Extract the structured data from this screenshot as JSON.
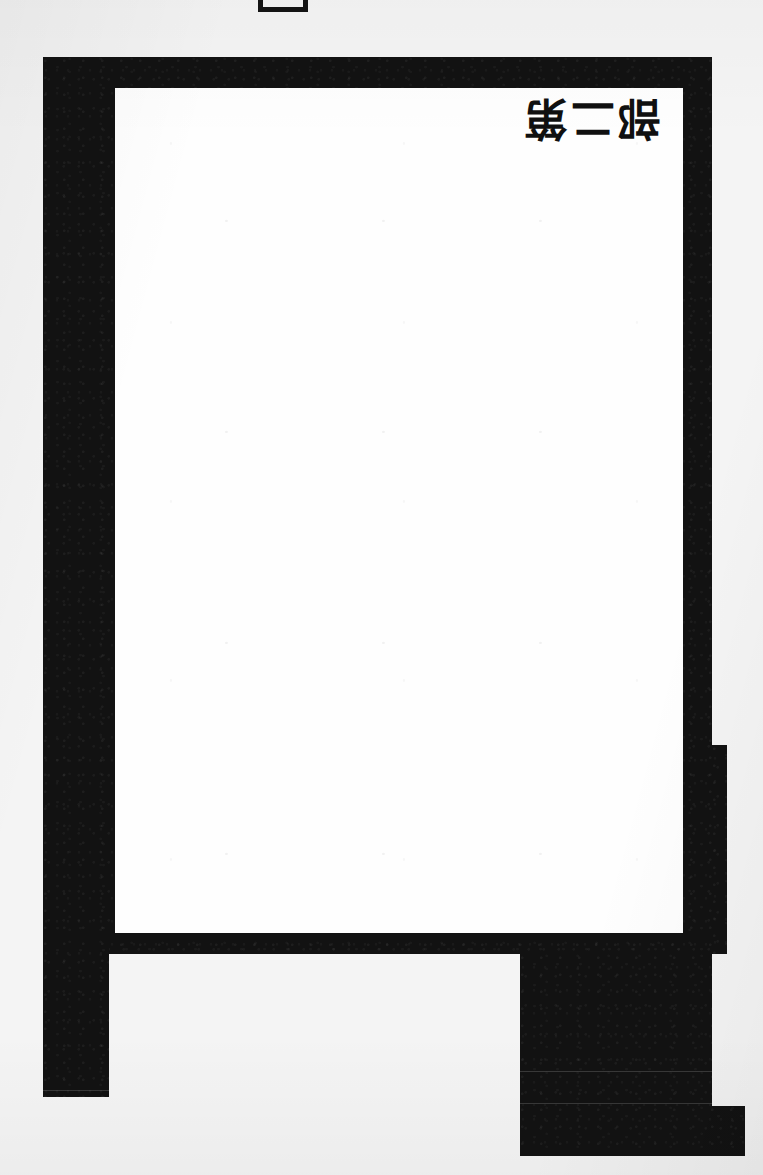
{
  "document": {
    "kind": "scanned-page",
    "orientation": "rotated-90",
    "background_color": "#f4f4f4",
    "ink_color": "#121212",
    "page_color": "#fefefe",
    "width_px": 763,
    "height_px": 1175
  },
  "top_mark": {
    "name": "register-mark",
    "shape": "open-rectangle",
    "stroke_color": "#141414"
  },
  "frame": {
    "label": "black-border-frame",
    "color": "#121212"
  },
  "inner_page": {
    "label": "white-page-area",
    "color": "#fefefe"
  },
  "vertical_title": {
    "orientation": "vertical",
    "characters": [
      "第",
      "二",
      "部"
    ],
    "line_1": "第",
    "line_2": "二",
    "line_3": "部",
    "color": "#101010"
  },
  "lower_shapes": {
    "left_leg": "left-vertical-bar",
    "lower_block": "lower-right-block",
    "bottom_bar": "bottom-step-bar",
    "right_step": "right-edge-step"
  },
  "seams": {
    "count": 3,
    "description": "faint horizontal scan seams"
  }
}
